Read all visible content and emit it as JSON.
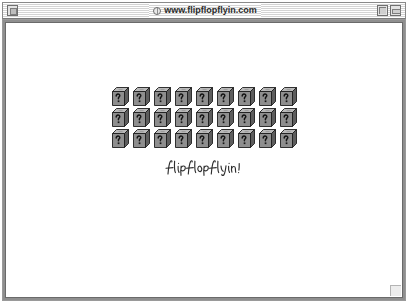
{
  "window": {
    "title": "www.flipflopflyin.com",
    "globe_icon": "globe-icon",
    "close_box_label": "",
    "zoom_box_label": "",
    "collapse_box_label": ""
  },
  "page": {
    "signature_text": "flipflopflyin!",
    "cube_icon_name": "question-mark-cube-icon",
    "grid": {
      "rows": 3,
      "columns": 9,
      "total": 27
    }
  },
  "colors": {
    "titlebar_stripe_light": "#ffffff",
    "titlebar_stripe_dark": "#d4d4d4",
    "window_frame": "#8f8f8f",
    "page_background": "#ffffff",
    "cube_top": "#b8b8b8",
    "cube_front": "#8c8c8c",
    "cube_side": "#5e5e5e",
    "ink": "#2b2b2b"
  }
}
